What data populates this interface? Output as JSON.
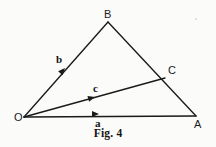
{
  "figure": {
    "caption": "Fig. 4",
    "background_color": "#fbfbfa",
    "ink_color": "#1a1a1a",
    "width": 216,
    "height": 147
  },
  "vertices": [
    {
      "id": "O",
      "label": "O",
      "x": 24,
      "y": 117,
      "label_x": 14,
      "label_y": 112
    },
    {
      "id": "B",
      "label": "B",
      "x": 108,
      "y": 22,
      "label_x": 104,
      "label_y": 9
    },
    {
      "id": "A",
      "label": "A",
      "x": 196,
      "y": 116,
      "label_x": 194,
      "label_y": 119
    },
    {
      "id": "C",
      "label": "C",
      "x": 165,
      "y": 78,
      "label_x": 168,
      "label_y": 65
    }
  ],
  "segments": [
    {
      "name": "side-OB",
      "from": "O",
      "to": "B",
      "x1": 24,
      "y1": 117,
      "x2": 108,
      "y2": 22
    },
    {
      "name": "side-BA",
      "from": "B",
      "to": "A",
      "x1": 108,
      "y1": 22,
      "x2": 196,
      "y2": 116
    },
    {
      "name": "side-OA",
      "from": "O",
      "to": "A",
      "x1": 24,
      "y1": 117,
      "x2": 196,
      "y2": 116
    },
    {
      "name": "segment-OC",
      "from": "O",
      "to": "C",
      "x1": 24,
      "y1": 117,
      "x2": 165,
      "y2": 78
    }
  ],
  "vectors": [
    {
      "name": "vector-b",
      "label": "b",
      "along": "side-OB",
      "arrow_x": 65,
      "arrow_y": 68,
      "arrow_angle": -48.5,
      "label_x": 56,
      "label_y": 54
    },
    {
      "name": "vector-c",
      "label": "c",
      "along": "segment-OC",
      "arrow_x": 95,
      "arrow_y": 97,
      "arrow_angle": -15.5,
      "label_x": 93,
      "label_y": 83
    },
    {
      "name": "vector-a",
      "label": "a",
      "along": "side-OA",
      "arrow_x": 99,
      "arrow_y": 114,
      "arrow_angle": -0.3,
      "label_x": 95,
      "label_y": 118
    }
  ],
  "arrowheads": {
    "length": 7,
    "half_width": 3
  }
}
